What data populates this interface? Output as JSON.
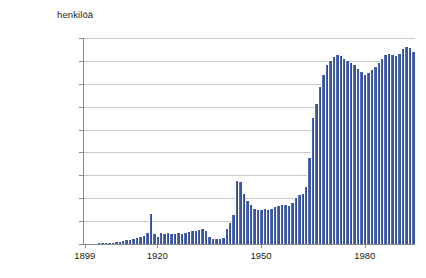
{
  "chart_data": {
    "type": "bar",
    "title": "",
    "unit_caption": "henkilöä",
    "xlabel": "",
    "ylabel": "henkilöä",
    "ylim": [
      0,
      180000
    ],
    "ytick_labels": [
      "180 000",
      "160 000",
      "140 000",
      "120 000",
      "100 000",
      "80 000",
      "60 000",
      "40 000",
      "20 000",
      "0"
    ],
    "ytick_values": [
      180000,
      160000,
      140000,
      120000,
      100000,
      80000,
      60000,
      40000,
      20000,
      0
    ],
    "xtick_labels": [
      "1899",
      "1920",
      "1950",
      "1980"
    ],
    "xtick_values": [
      1899,
      1920,
      1950,
      1980
    ],
    "grid": true,
    "legend": "none",
    "bar_color": "#3e5aa6",
    "x": [
      1899,
      1900,
      1901,
      1902,
      1903,
      1904,
      1905,
      1906,
      1907,
      1908,
      1909,
      1910,
      1911,
      1912,
      1913,
      1914,
      1915,
      1916,
      1917,
      1918,
      1919,
      1920,
      1921,
      1922,
      1923,
      1924,
      1925,
      1926,
      1927,
      1928,
      1929,
      1930,
      1931,
      1932,
      1933,
      1934,
      1935,
      1936,
      1937,
      1938,
      1939,
      1940,
      1941,
      1942,
      1943,
      1944,
      1945,
      1946,
      1947,
      1948,
      1949,
      1950,
      1951,
      1952,
      1953,
      1954,
      1955,
      1956,
      1957,
      1958,
      1959,
      1960,
      1961,
      1962,
      1963,
      1964,
      1965,
      1966,
      1967,
      1968,
      1969,
      1970,
      1971,
      1972,
      1973,
      1974,
      1975,
      1976,
      1977,
      1978,
      1979,
      1980,
      1981,
      1982,
      1983,
      1984,
      1985,
      1986,
      1987,
      1988,
      1989,
      1990,
      1991,
      1992,
      1993,
      1994
    ],
    "values": [
      200,
      250,
      300,
      400,
      500,
      600,
      800,
      1000,
      1300,
      1600,
      2000,
      2600,
      3200,
      3900,
      4600,
      5300,
      6200,
      7400,
      9500,
      26000,
      9000,
      6000,
      9500,
      8800,
      9200,
      8400,
      8800,
      9200,
      8600,
      9300,
      10200,
      11000,
      11500,
      12200,
      12800,
      11500,
      6500,
      4800,
      4200,
      4500,
      5200,
      13000,
      18000,
      25000,
      55000,
      54000,
      44000,
      38000,
      34000,
      31000,
      30000,
      30000,
      31000,
      30000,
      31000,
      32000,
      33000,
      34000,
      34000,
      33000,
      36000,
      40000,
      43000,
      44000,
      50000,
      75000,
      110000,
      122000,
      137000,
      148000,
      156000,
      160000,
      163000,
      165000,
      164000,
      162000,
      160000,
      158000,
      156000,
      153000,
      150000,
      148000,
      149000,
      152000,
      155000,
      158000,
      162000,
      165000,
      166000,
      165000,
      164000,
      166000,
      170000,
      172000,
      171000,
      168000
    ]
  }
}
